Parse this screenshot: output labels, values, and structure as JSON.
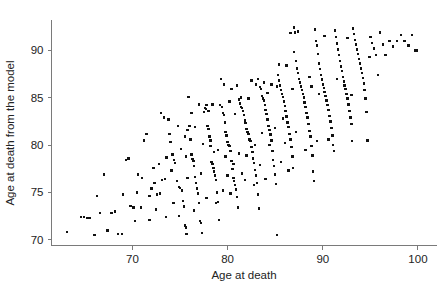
{
  "chart_data": {
    "type": "scatter",
    "title": "",
    "xlabel": "Age at death",
    "ylabel": "Age at death from the model",
    "xlim": [
      61.5,
      102.0
    ],
    "ylim": [
      69.4,
      93.2
    ],
    "xticks": [
      70,
      80,
      90,
      100
    ],
    "xtick_labels": [
      "70",
      "80",
      "90",
      "100"
    ],
    "yticks": [
      70,
      75,
      80,
      85,
      90
    ],
    "ytick_labels": [
      "70",
      "75",
      "80",
      "85",
      "90"
    ],
    "grid": false,
    "legend": null,
    "marker": "square",
    "marker_color": "#111111",
    "marker_size_px": 2.4,
    "n_points": 322,
    "correlation_approx": 0.86,
    "points": [
      [
        63.1,
        70.8
      ],
      [
        64.6,
        72.4
      ],
      [
        64.9,
        72.4
      ],
      [
        65.2,
        72.3
      ],
      [
        65.5,
        72.3
      ],
      [
        66.0,
        70.5
      ],
      [
        66.3,
        74.6
      ],
      [
        66.6,
        72.8
      ],
      [
        67.0,
        76.9
      ],
      [
        67.4,
        71.0
      ],
      [
        67.8,
        72.8
      ],
      [
        68.2,
        73.0
      ],
      [
        68.5,
        70.6
      ],
      [
        68.9,
        70.6
      ],
      [
        69.3,
        78.4
      ],
      [
        69.6,
        78.6
      ],
      [
        69.8,
        73.6
      ],
      [
        70.1,
        73.4
      ],
      [
        70.3,
        72.0
      ],
      [
        70.6,
        76.9
      ],
      [
        70.9,
        73.4
      ],
      [
        71.2,
        80.5
      ],
      [
        71.5,
        81.2
      ],
      [
        71.8,
        72.1
      ],
      [
        72.0,
        75.4
      ],
      [
        72.3,
        76.0
      ],
      [
        72.6,
        74.8
      ],
      [
        72.9,
        74.9
      ],
      [
        73.1,
        76.3
      ],
      [
        73.4,
        76.4
      ],
      [
        73.6,
        78.7
      ],
      [
        73.8,
        82.7
      ],
      [
        74.0,
        80.3
      ],
      [
        74.2,
        79.0
      ],
      [
        74.4,
        78.4
      ],
      [
        74.5,
        78.1
      ],
      [
        74.7,
        76.2
      ],
      [
        74.9,
        75.6
      ],
      [
        75.0,
        75.5
      ],
      [
        75.2,
        75.2
      ],
      [
        75.3,
        74.1
      ],
      [
        75.4,
        73.5
      ],
      [
        75.5,
        71.5
      ],
      [
        75.6,
        71.3
      ],
      [
        75.7,
        70.6
      ],
      [
        75.8,
        81.6
      ],
      [
        75.9,
        85.1
      ],
      [
        76.0,
        82.0
      ],
      [
        76.1,
        80.6
      ],
      [
        76.2,
        79.0
      ],
      [
        76.3,
        78.5
      ],
      [
        76.4,
        78.3
      ],
      [
        76.5,
        77.8
      ],
      [
        76.6,
        76.6
      ],
      [
        76.7,
        76.0
      ],
      [
        76.8,
        75.4
      ],
      [
        76.9,
        74.9
      ],
      [
        77.0,
        73.9
      ],
      [
        77.1,
        72.0
      ],
      [
        77.2,
        71.8
      ],
      [
        77.3,
        70.7
      ],
      [
        77.5,
        83.5
      ],
      [
        77.6,
        83.9
      ],
      [
        77.7,
        83.8
      ],
      [
        77.8,
        84.2
      ],
      [
        77.9,
        82.0
      ],
      [
        78.0,
        81.7
      ],
      [
        78.1,
        80.9
      ],
      [
        78.2,
        79.9
      ],
      [
        78.3,
        78.2
      ],
      [
        78.4,
        78.0
      ],
      [
        78.5,
        77.6
      ],
      [
        78.6,
        77.2
      ],
      [
        78.7,
        76.8
      ],
      [
        78.8,
        76.3
      ],
      [
        78.9,
        75.0
      ],
      [
        79.0,
        74.0
      ],
      [
        79.1,
        72.1
      ],
      [
        79.3,
        87.0
      ],
      [
        79.4,
        84.0
      ],
      [
        79.5,
        83.4
      ],
      [
        79.6,
        83.2
      ],
      [
        79.7,
        82.4
      ],
      [
        79.8,
        81.4
      ],
      [
        79.9,
        81.0
      ],
      [
        80.0,
        80.3
      ],
      [
        80.1,
        80.0
      ],
      [
        80.2,
        79.9
      ],
      [
        80.3,
        79.4
      ],
      [
        80.4,
        78.3
      ],
      [
        80.5,
        77.5
      ],
      [
        80.6,
        76.5
      ],
      [
        80.7,
        76.2
      ],
      [
        80.8,
        75.8
      ],
      [
        80.9,
        75.3
      ],
      [
        81.0,
        74.5
      ],
      [
        81.1,
        73.4
      ],
      [
        81.2,
        84.8
      ],
      [
        81.3,
        84.4
      ],
      [
        81.4,
        84.0
      ],
      [
        81.5,
        83.9
      ],
      [
        81.6,
        83.6
      ],
      [
        81.7,
        83.2
      ],
      [
        81.8,
        82.6
      ],
      [
        81.9,
        82.3
      ],
      [
        82.0,
        81.7
      ],
      [
        82.1,
        81.4
      ],
      [
        82.2,
        81.2
      ],
      [
        82.3,
        80.6
      ],
      [
        82.4,
        80.4
      ],
      [
        82.5,
        79.8
      ],
      [
        82.6,
        79.3
      ],
      [
        82.7,
        78.6
      ],
      [
        82.8,
        78.1
      ],
      [
        82.9,
        77.4
      ],
      [
        83.0,
        76.8
      ],
      [
        83.1,
        76.0
      ],
      [
        83.2,
        74.8
      ],
      [
        83.3,
        73.3
      ],
      [
        83.4,
        86.1
      ],
      [
        83.5,
        85.9
      ],
      [
        83.6,
        85.2
      ],
      [
        83.7,
        84.9
      ],
      [
        83.8,
        84.7
      ],
      [
        83.9,
        84.2
      ],
      [
        84.0,
        83.7
      ],
      [
        84.1,
        83.3
      ],
      [
        84.2,
        82.7
      ],
      [
        84.3,
        82.0
      ],
      [
        84.4,
        81.6
      ],
      [
        84.5,
        81.1
      ],
      [
        84.6,
        80.5
      ],
      [
        84.7,
        79.4
      ],
      [
        84.8,
        78.4
      ],
      [
        84.9,
        77.8
      ],
      [
        85.0,
        76.9
      ],
      [
        85.1,
        75.9
      ],
      [
        85.2,
        70.5
      ],
      [
        85.3,
        87.4
      ],
      [
        85.4,
        86.8
      ],
      [
        85.5,
        86.3
      ],
      [
        85.6,
        85.8
      ],
      [
        85.7,
        85.4
      ],
      [
        85.8,
        85.1
      ],
      [
        85.9,
        84.6
      ],
      [
        86.0,
        84.1
      ],
      [
        86.1,
        83.6
      ],
      [
        86.2,
        83.0
      ],
      [
        86.3,
        82.4
      ],
      [
        86.4,
        81.9
      ],
      [
        86.5,
        81.2
      ],
      [
        86.6,
        80.6
      ],
      [
        86.7,
        79.8
      ],
      [
        86.8,
        78.8
      ],
      [
        86.9,
        77.6
      ],
      [
        87.0,
        92.4
      ],
      [
        87.1,
        91.9
      ],
      [
        87.2,
        88.9
      ],
      [
        87.3,
        88.1
      ],
      [
        87.4,
        87.6
      ],
      [
        87.5,
        87.0
      ],
      [
        87.6,
        86.6
      ],
      [
        87.7,
        86.2
      ],
      [
        87.8,
        85.8
      ],
      [
        87.9,
        85.4
      ],
      [
        88.0,
        85.0
      ],
      [
        88.1,
        84.5
      ],
      [
        88.2,
        84.0
      ],
      [
        88.3,
        83.4
      ],
      [
        88.4,
        82.9
      ],
      [
        88.5,
        82.2
      ],
      [
        88.6,
        81.5
      ],
      [
        88.7,
        80.9
      ],
      [
        88.8,
        79.9
      ],
      [
        88.9,
        78.9
      ],
      [
        89.0,
        77.2
      ],
      [
        89.1,
        76.2
      ],
      [
        89.2,
        92.2
      ],
      [
        89.3,
        91.0
      ],
      [
        89.4,
        90.5
      ],
      [
        89.5,
        89.6
      ],
      [
        89.6,
        88.6
      ],
      [
        89.7,
        88.0
      ],
      [
        89.8,
        87.4
      ],
      [
        89.9,
        86.9
      ],
      [
        90.0,
        86.4
      ],
      [
        90.1,
        86.0
      ],
      [
        90.2,
        85.6
      ],
      [
        90.3,
        85.2
      ],
      [
        90.4,
        84.7
      ],
      [
        90.5,
        84.2
      ],
      [
        90.6,
        83.7
      ],
      [
        90.7,
        83.1
      ],
      [
        90.8,
        82.5
      ],
      [
        90.9,
        81.8
      ],
      [
        91.0,
        81.0
      ],
      [
        91.1,
        80.0
      ],
      [
        91.2,
        79.4
      ],
      [
        91.3,
        92.1
      ],
      [
        91.4,
        91.4
      ],
      [
        91.5,
        90.7
      ],
      [
        91.6,
        90.1
      ],
      [
        91.7,
        89.5
      ],
      [
        91.8,
        88.9
      ],
      [
        91.9,
        88.3
      ],
      [
        92.0,
        87.8
      ],
      [
        92.1,
        87.2
      ],
      [
        92.2,
        86.7
      ],
      [
        92.3,
        86.3
      ],
      [
        92.4,
        85.9
      ],
      [
        92.5,
        85.4
      ],
      [
        92.6,
        84.9
      ],
      [
        92.7,
        84.3
      ],
      [
        92.8,
        83.6
      ],
      [
        92.9,
        82.9
      ],
      [
        93.0,
        82.2
      ],
      [
        93.1,
        80.4
      ],
      [
        93.2,
        92.3
      ],
      [
        93.3,
        91.7
      ],
      [
        93.4,
        91.1
      ],
      [
        93.5,
        90.6
      ],
      [
        93.6,
        90.1
      ],
      [
        93.7,
        89.6
      ],
      [
        93.8,
        89.1
      ],
      [
        93.9,
        88.6
      ],
      [
        94.0,
        88.1
      ],
      [
        94.1,
        87.6
      ],
      [
        94.2,
        87.1
      ],
      [
        94.3,
        86.5
      ],
      [
        94.4,
        85.8
      ],
      [
        94.5,
        84.9
      ],
      [
        94.6,
        83.5
      ],
      [
        94.7,
        80.5
      ],
      [
        95.0,
        91.4
      ],
      [
        95.2,
        90.8
      ],
      [
        95.4,
        90.2
      ],
      [
        95.6,
        89.5
      ],
      [
        95.8,
        87.4
      ],
      [
        96.0,
        91.9
      ],
      [
        96.3,
        90.6
      ],
      [
        96.6,
        89.5
      ],
      [
        97.0,
        91.0
      ],
      [
        97.4,
        90.4
      ],
      [
        97.8,
        91.0
      ],
      [
        98.2,
        91.6
      ],
      [
        98.6,
        91.0
      ],
      [
        99.0,
        90.5
      ],
      [
        99.4,
        91.6
      ],
      [
        99.7,
        90.0
      ],
      [
        99.9,
        90.0
      ],
      [
        73.0,
        83.4
      ],
      [
        73.3,
        82.9
      ],
      [
        74.8,
        82.0
      ],
      [
        75.1,
        79.6
      ],
      [
        75.6,
        78.8
      ],
      [
        76.2,
        83.4
      ],
      [
        77.0,
        84.3
      ],
      [
        78.0,
        83.6
      ],
      [
        78.4,
        84.3
      ],
      [
        79.2,
        84.2
      ],
      [
        80.2,
        84.6
      ],
      [
        80.8,
        83.3
      ],
      [
        81.4,
        85.0
      ],
      [
        82.2,
        84.9
      ],
      [
        83.0,
        86.4
      ],
      [
        83.8,
        86.6
      ],
      [
        84.6,
        86.4
      ],
      [
        85.4,
        88.5
      ],
      [
        86.2,
        88.4
      ],
      [
        87.0,
        89.8
      ],
      [
        71.0,
        76.5
      ],
      [
        72.5,
        73.2
      ],
      [
        73.5,
        72.4
      ],
      [
        74.3,
        73.9
      ],
      [
        74.9,
        72.5
      ],
      [
        76.5,
        73.1
      ],
      [
        77.8,
        74.4
      ],
      [
        78.8,
        73.9
      ],
      [
        79.5,
        75.2
      ],
      [
        80.3,
        74.9
      ],
      [
        81.5,
        77.0
      ],
      [
        82.8,
        75.8
      ],
      [
        84.0,
        76.4
      ],
      [
        85.6,
        78.2
      ],
      [
        86.4,
        77.3
      ],
      [
        72.8,
        78.0
      ],
      [
        73.9,
        81.2
      ],
      [
        75.5,
        80.9
      ],
      [
        76.6,
        81.9
      ],
      [
        77.4,
        80.1
      ],
      [
        78.2,
        80.5
      ],
      [
        79.0,
        79.5
      ],
      [
        79.8,
        78.8
      ],
      [
        80.6,
        78.0
      ],
      [
        81.2,
        79.1
      ],
      [
        82.0,
        78.9
      ],
      [
        82.9,
        80.0
      ],
      [
        83.6,
        81.3
      ],
      [
        84.4,
        80.0
      ],
      [
        85.0,
        81.8
      ],
      [
        86.0,
        80.2
      ],
      [
        87.2,
        81.4
      ],
      [
        88.2,
        79.5
      ],
      [
        89.4,
        80.4
      ],
      [
        90.6,
        80.6
      ],
      [
        69.0,
        74.8
      ],
      [
        70.5,
        75.0
      ],
      [
        71.8,
        74.6
      ],
      [
        72.2,
        77.6
      ],
      [
        74.1,
        77.3
      ],
      [
        75.8,
        76.5
      ],
      [
        77.2,
        77.0
      ],
      [
        78.6,
        79.3
      ],
      [
        80.0,
        76.8
      ],
      [
        81.8,
        76.3
      ],
      [
        83.4,
        77.9
      ],
      [
        85.8,
        82.8
      ],
      [
        88.6,
        87.2
      ],
      [
        91.5,
        87.0
      ],
      [
        93.0,
        85.3
      ],
      [
        86.6,
        91.8
      ],
      [
        87.4,
        92.0
      ],
      [
        90.2,
        91.5
      ],
      [
        92.6,
        91.3
      ],
      [
        94.9,
        89.3
      ],
      [
        84.2,
        85.5
      ],
      [
        85.2,
        86.2
      ],
      [
        86.8,
        85.9
      ],
      [
        88.8,
        86.2
      ],
      [
        89.6,
        85.4
      ],
      [
        79.6,
        86.4
      ],
      [
        81.0,
        86.3
      ],
      [
        82.5,
        86.8
      ],
      [
        83.2,
        87.0
      ],
      [
        80.4,
        85.9
      ]
    ]
  }
}
